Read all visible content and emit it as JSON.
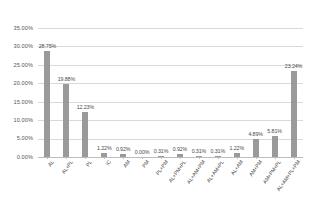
{
  "chart_data": {
    "type": "bar",
    "title": "",
    "subtitle": "",
    "xlabel": "",
    "ylabel": "",
    "ylim": [
      0,
      35
    ],
    "ytick_labels": [
      "35.00%",
      "30.00%",
      "25.00%",
      "20.00%",
      "15.00%",
      "10.00%",
      "5.00%",
      "0.00%"
    ],
    "ytick_values": [
      35,
      30,
      25,
      20,
      15,
      10,
      5,
      0
    ],
    "grid": true,
    "legend": false,
    "categories": [
      "AL",
      "AL+PL",
      "PL",
      "IC",
      "AM",
      "PM",
      "PL+PM",
      "AL+PM+PL",
      "AL+AM+PM",
      "AL+AM+PL",
      "AL+AM",
      "AM+PM",
      "AM+PM+PL",
      "AL+AM+PL+PM"
    ],
    "values": [
      28.75,
      19.88,
      12.23,
      1.22,
      0.92,
      0.0,
      0.31,
      0.92,
      0.31,
      0.31,
      1.22,
      4.89,
      5.81,
      23.24
    ],
    "value_labels": [
      "28.75%",
      "19.88%",
      "12.23%",
      "1.22%",
      "0.92%",
      "0.00%",
      "0.31%",
      "0.92%",
      "0.31%",
      "0.31%",
      "1.22%",
      "4.89%",
      "5.81%",
      "23.24%"
    ],
    "bar_color": "#9a9a9a",
    "grid_color": "#d9d9d9",
    "background_color": "#ffffff",
    "label_color": "#4a4a4a"
  }
}
